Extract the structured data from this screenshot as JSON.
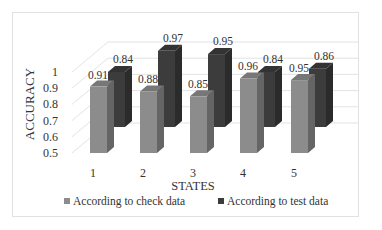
{
  "chart_data": {
    "type": "bar",
    "style": "3d-clustered-column",
    "title": "",
    "xlabel": "STATES",
    "ylabel": "ACCURACY",
    "categories": [
      "1",
      "2",
      "3",
      "4",
      "5"
    ],
    "series": [
      {
        "name": "According to check data",
        "color": "#8c8c8c",
        "values": [
          0.91,
          0.88,
          0.85,
          0.96,
          0.95
        ]
      },
      {
        "name": "According to test data",
        "color": "#3c3c3c",
        "values": [
          0.84,
          0.97,
          0.95,
          0.84,
          0.86
        ]
      }
    ],
    "data_labels": {
      "check": [
        "0.91",
        "0.88",
        "0.85",
        "0.96",
        "0.95"
      ],
      "test": [
        "0.84",
        "0.97",
        "0.95",
        "0.84",
        "0.86"
      ]
    },
    "yticks": [
      "0.5",
      "0.6",
      "0.7",
      "0.8",
      "0.9",
      "1"
    ],
    "ylim": [
      0.5,
      1.0
    ],
    "grid": true,
    "legend_position": "bottom"
  },
  "axes": {
    "xlabel": "STATES",
    "ylabel": "ACCURACY"
  },
  "legend": [
    {
      "label": "According to check data",
      "color": "#8c8c8c"
    },
    {
      "label": "According to test data",
      "color": "#3c3c3c"
    }
  ]
}
